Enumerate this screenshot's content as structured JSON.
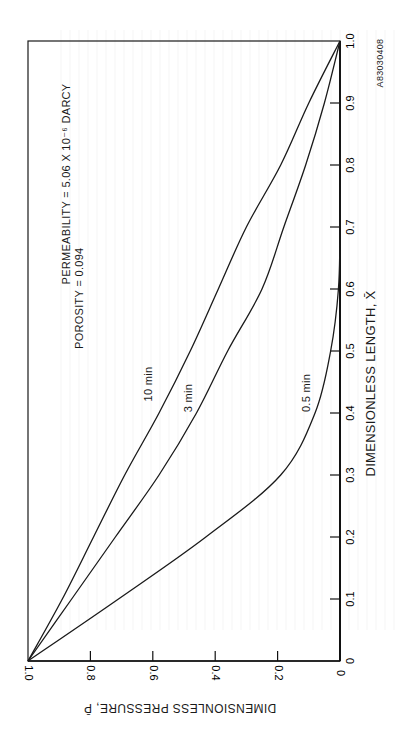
{
  "chart_data": {
    "type": "line",
    "orientation": "rotated 90 degrees counter-clockwise on page",
    "title": "",
    "xlabel": "DIMENSIONLESS LENGTH, X̄",
    "ylabel": "DIMENSIONLESS PRESSURE, P̄",
    "xlim": [
      0,
      1.0
    ],
    "ylim": [
      0,
      1.0
    ],
    "x_ticks": [
      "0",
      "0.1",
      "0.2",
      "0.3",
      "0.4",
      "0.5",
      "0.6",
      "0.7",
      "0.8",
      "0.9",
      "1.0"
    ],
    "y_ticks": [
      "0",
      "0.2",
      "0.4",
      "0.6",
      "0.8",
      "1.0"
    ],
    "grid": false,
    "x": [
      0,
      0.1,
      0.2,
      0.3,
      0.4,
      0.5,
      0.6,
      0.7,
      0.8,
      0.9,
      1.0
    ],
    "series": [
      {
        "name": "10 min",
        "values": [
          1.0,
          0.89,
          0.79,
          0.69,
          0.58,
          0.48,
          0.39,
          0.3,
          0.19,
          0.1,
          0.0
        ]
      },
      {
        "name": "3 min",
        "values": [
          1.0,
          0.86,
          0.72,
          0.58,
          0.46,
          0.36,
          0.25,
          0.18,
          0.11,
          0.05,
          0.0
        ]
      },
      {
        "name": "0.5 min",
        "values": [
          1.0,
          0.71,
          0.43,
          0.19,
          0.08,
          0.03,
          0.005,
          0.0,
          0.0,
          0.0,
          0.0
        ]
      }
    ],
    "annotations": [
      "PERMEABILITY = 5.06 X 10⁻⁶ DARCY",
      "POROSITY = 0.094"
    ],
    "figure_id": "A83030408"
  },
  "labels": {
    "xaxis": "DIMENSIONLESS LENGTH, X̄",
    "yaxis": "DIMENSIONLESS PRESSURE, P̄",
    "permeability": "PERMEABILITY = 5.06 X 10⁻⁶ DARCY",
    "porosity": "POROSITY = 0.094",
    "figure_id": "A83030408",
    "curve_10": "10 min",
    "curve_3": "3 min",
    "curve_05": "0.5 min"
  }
}
